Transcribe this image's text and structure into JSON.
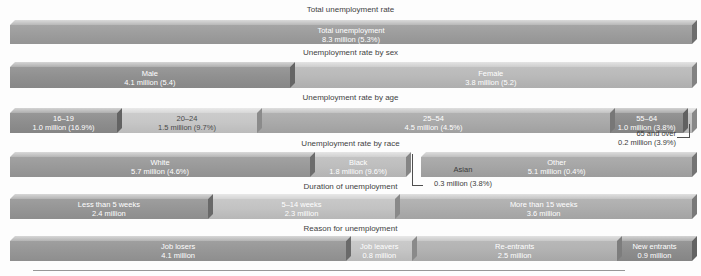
{
  "page": {
    "background": "#fdfdfd"
  },
  "chart_data": {
    "type": "bar",
    "orientation": "horizontal",
    "total_unemployment_millions": 8.3,
    "total_unemployment_rate_pct": 5.3,
    "sections": [
      {
        "id": "total",
        "title": "Total unemployment rate",
        "segments": [
          {
            "label": "Total unemployment",
            "value_text": "8.3 million (5.3%)",
            "amount_millions": 8.3,
            "rate_pct": 5.3,
            "width_frac": 1.0,
            "color": "#9d9d9d",
            "text_color": "#ffffff"
          }
        ]
      },
      {
        "id": "sex",
        "title": "Unemployment rate by sex",
        "segments": [
          {
            "label": "Male",
            "value_text": "4.1 million (5.4)",
            "amount_millions": 4.1,
            "rate_pct": 5.4,
            "width_frac": 0.41,
            "color": "#909090",
            "text_color": "#ffffff"
          },
          {
            "label": "Female",
            "value_text": "3.8 million (5.2)",
            "amount_millions": 3.8,
            "rate_pct": 5.2,
            "width_frac": 0.59,
            "color": "#b9b9b9",
            "text_color": "#ffffff"
          }
        ]
      },
      {
        "id": "age",
        "title": "Unemployment rate by age",
        "segments": [
          {
            "label": "16–19",
            "value_text": "1.0 million (16.9%)",
            "amount_millions": 1.0,
            "rate_pct": 16.9,
            "width_frac": 0.157,
            "color": "#8e8e8e",
            "text_color": "#ffffff"
          },
          {
            "label": "20–24",
            "value_text": "1.5 million (9.7%)",
            "amount_millions": 1.5,
            "rate_pct": 9.7,
            "width_frac": 0.205,
            "color": "#c7c7c7",
            "text_color": "#4a4a4a"
          },
          {
            "label": "25–54",
            "value_text": "4.5 million (4.5%)",
            "amount_millions": 4.5,
            "rate_pct": 4.5,
            "width_frac": 0.518,
            "color": "#aaaaaa",
            "text_color": "#ffffff"
          },
          {
            "label": "55–64",
            "value_text": "1.0 million (3.8%)",
            "amount_millions": 1.0,
            "rate_pct": 3.8,
            "width_frac": 0.107,
            "color": "#8b8b8b",
            "text_color": "#ffffff"
          },
          {
            "label": "",
            "value_text": "",
            "amount_millions": 0.2,
            "rate_pct": 3.9,
            "width_frac": 0.013,
            "color": "#c2c2c2",
            "text_color": "#ffffff",
            "sliver": true
          }
        ],
        "callout": {
          "lines": [
            "65 and over",
            "0.2 million (3.9%)"
          ],
          "amount_millions": 0.2,
          "rate_pct": 3.9
        }
      },
      {
        "id": "race",
        "title": "Unemployment rate by race",
        "segments": [
          {
            "label": "White",
            "value_text": "5.7 million (4.6%)",
            "amount_millions": 5.7,
            "rate_pct": 4.6,
            "width_frac": 0.44,
            "color": "#9a9a9a",
            "text_color": "#ffffff"
          },
          {
            "label": "Black",
            "value_text": "1.8 million (9.6%)",
            "amount_millions": 1.8,
            "rate_pct": 9.6,
            "width_frac": 0.141,
            "color": "#bebebe",
            "text_color": "#ffffff"
          },
          {
            "label": "",
            "value_text": "",
            "amount_millions": 0.3,
            "rate_pct": 3.8,
            "width_frac": 0.022,
            "color": "",
            "text_color": "",
            "gap": true
          },
          {
            "label": "Other",
            "value_text": "5.1 million (0.4%)",
            "amount_millions": 5.1,
            "rate_pct": 0.4,
            "width_frac": 0.397,
            "color": "#a6a6a6",
            "text_color": "#ffffff"
          }
        ],
        "callout": {
          "lines": [
            "Asian",
            "0.3 million (3.8%)"
          ],
          "amount_millions": 0.3,
          "rate_pct": 3.8
        }
      },
      {
        "id": "duration",
        "title": "Duration of unemployment",
        "segments": [
          {
            "label": "Less than 5 weeks",
            "value_text": "2.4 million",
            "amount_millions": 2.4,
            "width_frac": 0.29,
            "color": "#969696",
            "text_color": "#ffffff"
          },
          {
            "label": "5–14 weeks",
            "value_text": "2.3 million",
            "amount_millions": 2.3,
            "width_frac": 0.275,
            "color": "#c3c3c3",
            "text_color": "#ffffff"
          },
          {
            "label": "More than 15 weeks",
            "value_text": "3.6 million",
            "amount_millions": 3.6,
            "width_frac": 0.435,
            "color": "#adadad",
            "text_color": "#ffffff"
          }
        ]
      },
      {
        "id": "reason",
        "title": "Reason for unemployment",
        "segments": [
          {
            "label": "Job losers",
            "value_text": "4.1 million",
            "amount_millions": 4.1,
            "width_frac": 0.493,
            "color": "#979797",
            "text_color": "#ffffff"
          },
          {
            "label": "Job leavers",
            "value_text": "0.8 million",
            "amount_millions": 0.8,
            "width_frac": 0.097,
            "color": "#c5c5c5",
            "text_color": "#ffffff"
          },
          {
            "label": "Re-entrants",
            "value_text": "2.5 million",
            "amount_millions": 2.5,
            "width_frac": 0.3,
            "color": "#b2b2b2",
            "text_color": "#ffffff"
          },
          {
            "label": "New entrants",
            "value_text": "0.9 million",
            "amount_millions": 0.9,
            "width_frac": 0.11,
            "color": "#8e8e8e",
            "text_color": "#ffffff"
          }
        ]
      }
    ]
  }
}
